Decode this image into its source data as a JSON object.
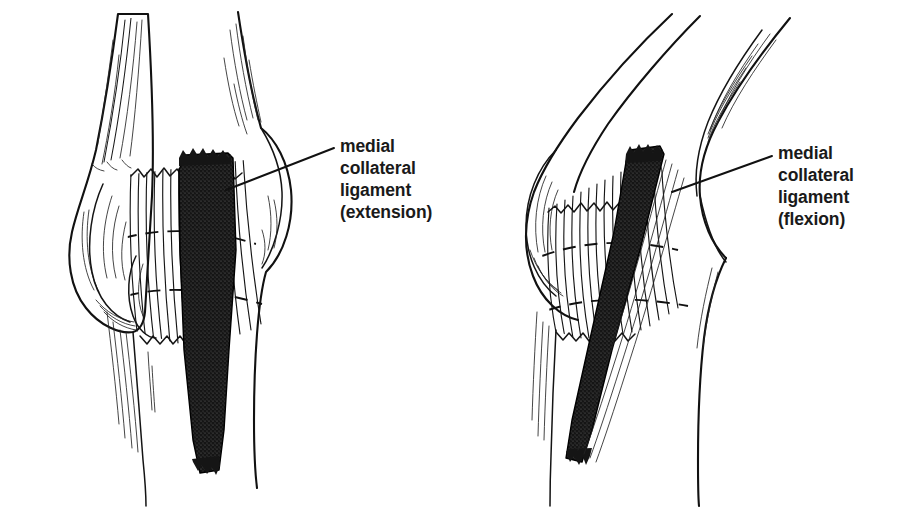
{
  "figure": {
    "background_color": "#ffffff",
    "ink_color": "#111111",
    "ligament_fill_color": "#1c1c1c",
    "width": 902,
    "height": 508
  },
  "panels": [
    {
      "id": "left-panel",
      "name": "elbow-extension",
      "view": "medial view of elbow joint, extended",
      "label": {
        "lines": [
          "medial",
          "collateral",
          "ligament",
          "(extension)"
        ],
        "line1": "medial",
        "line2": "collateral",
        "line3": "ligament",
        "line4": "(extension)",
        "text_x": 340,
        "line_y": [
          152,
          174,
          196,
          218
        ],
        "leader_from_x": 334,
        "leader_from_y": 148,
        "leader_to_x": 226,
        "leader_to_y": 190
      },
      "structures": [
        {
          "name": "humerus-shaft",
          "kind": "bone"
        },
        {
          "name": "medial-epicondyle",
          "kind": "bone-prominence"
        },
        {
          "name": "capitellum-trochlea",
          "kind": "bone-condyle"
        },
        {
          "name": "joint-capsule-fibers",
          "kind": "soft-tissue"
        },
        {
          "name": "ulna-shaft",
          "kind": "bone"
        },
        {
          "name": "medial-collateral-ligament",
          "kind": "ligament"
        }
      ]
    },
    {
      "id": "right-panel",
      "name": "elbow-flexion",
      "view": "medial view of elbow joint, flexed",
      "label": {
        "lines": [
          "medial",
          "collateral",
          "ligament",
          "(flexion)"
        ],
        "line1": "medial",
        "line2": "collateral",
        "line3": "ligament",
        "line4": "(flexion)",
        "text_x": 778,
        "line_y": [
          159,
          181,
          203,
          225
        ],
        "leader_from_x": 772,
        "leader_from_y": 156,
        "leader_to_x": 672,
        "leader_to_y": 192
      },
      "structures": [
        {
          "name": "humerus-shaft",
          "kind": "bone"
        },
        {
          "name": "olecranon",
          "kind": "bone"
        },
        {
          "name": "medial-epicondyle",
          "kind": "bone-prominence"
        },
        {
          "name": "joint-capsule-fibers",
          "kind": "soft-tissue"
        },
        {
          "name": "ulna-shaft",
          "kind": "bone"
        },
        {
          "name": "medial-collateral-ligament",
          "kind": "ligament"
        }
      ]
    }
  ]
}
